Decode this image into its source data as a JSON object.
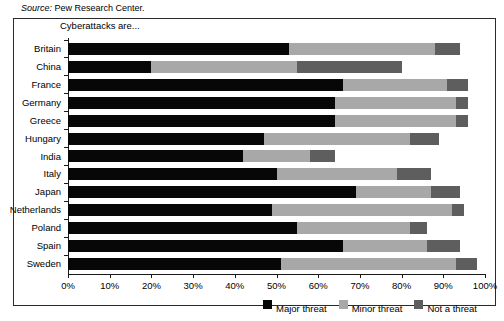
{
  "source_note": {
    "label": "Source:",
    "text": " Pew Research Center."
  },
  "chart_data": {
    "type": "bar",
    "orientation": "horizontal",
    "stacked": true,
    "title": "",
    "subtitle": "Cyberattacks are...",
    "xlabel": "",
    "ylabel": "",
    "xlim": [
      0,
      100
    ],
    "grid": false,
    "legend_position": "bottom-right",
    "categories": [
      "Britain",
      "China",
      "France",
      "Germany",
      "Greece",
      "Hungary",
      "India",
      "Italy",
      "Japan",
      "Netherlands",
      "Poland",
      "Spain",
      "Sweden"
    ],
    "series": [
      {
        "name": "Major threat",
        "color": "#070707",
        "values": [
          53,
          20,
          66,
          64,
          64,
          47,
          42,
          50,
          69,
          49,
          55,
          66,
          51
        ]
      },
      {
        "name": "Minor threat",
        "color": "#a8a8a8",
        "values": [
          35,
          35,
          25,
          29,
          29,
          35,
          16,
          29,
          18,
          43,
          27,
          20,
          42
        ]
      },
      {
        "name": "Not a threat",
        "color": "#5e5e5e",
        "values": [
          6,
          25,
          5,
          3,
          3,
          7,
          6,
          8,
          7,
          3,
          4,
          8,
          5
        ]
      }
    ],
    "x_ticks": [
      0,
      10,
      20,
      30,
      40,
      50,
      60,
      70,
      80,
      90,
      100
    ],
    "x_tick_labels": [
      "0%",
      "10%",
      "20%",
      "30%",
      "40%",
      "50%",
      "60%",
      "70%",
      "80%",
      "90%",
      "100%"
    ],
    "legend": [
      {
        "label": "Major threat",
        "color": "#070707"
      },
      {
        "label": "Minor threat",
        "color": "#a8a8a8"
      },
      {
        "label": "Not a threat",
        "color": "#5e5e5e"
      }
    ]
  }
}
